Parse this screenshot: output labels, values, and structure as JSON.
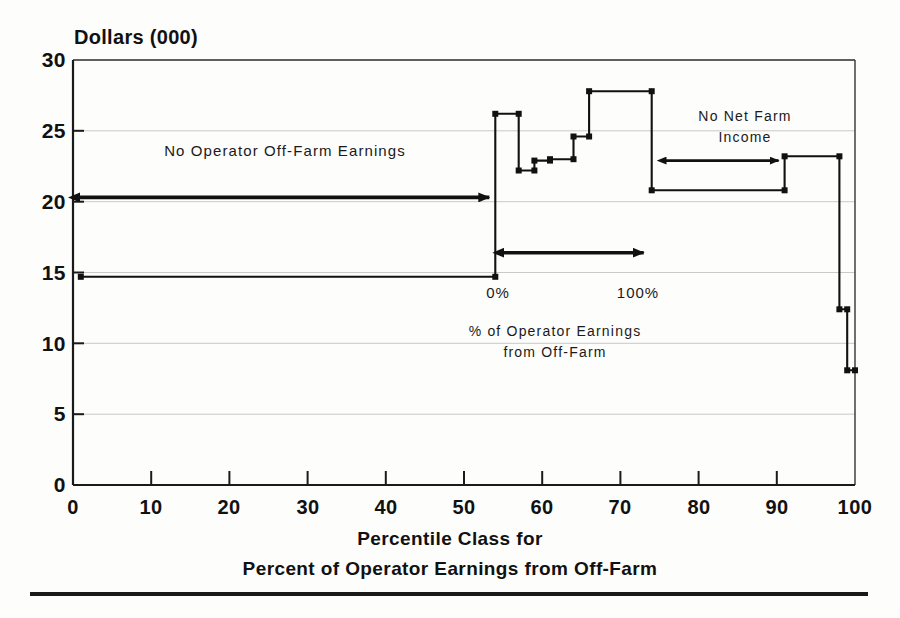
{
  "figure": {
    "ylabel": "Dollars (000)",
    "xtitle_line1": "Percentile Class for",
    "xtitle_line2": "Percent of Operator Earnings from Off-Farm",
    "annotations": {
      "left": "No Operator Off-Farm Earnings",
      "middle_line1": "% of Operator Earnings",
      "middle_line2": "from Off-Farm",
      "middle_start": "0%",
      "middle_end": "100%",
      "right_line1": "No Net Farm",
      "right_line2": "Income"
    },
    "colors": {
      "ink": "#111111",
      "grid": "#c9c9c9",
      "axis": "#222222",
      "background": "#fdfdfc"
    }
  },
  "chart_data": {
    "type": "line",
    "title": "",
    "subtitle": "",
    "xlabel": "Percentile Class for Percent of Operator Earnings from Off-Farm",
    "ylabel": "Dollars (000)",
    "xlim": [
      0,
      100
    ],
    "ylim": [
      0,
      30
    ],
    "xticks": [
      0,
      10,
      20,
      30,
      40,
      50,
      60,
      70,
      80,
      90,
      100
    ],
    "yticks": [
      0,
      5,
      10,
      15,
      20,
      25,
      30
    ],
    "grid": true,
    "legend": "none",
    "step_style": "post",
    "series": [
      {
        "name": "Total household income by percentile class",
        "x": [
          1,
          54,
          54,
          57,
          57,
          59,
          59,
          61,
          61,
          64,
          64,
          66,
          66,
          74,
          74,
          91,
          91,
          98,
          98,
          99,
          99,
          100
        ],
        "y": [
          14.7,
          14.7,
          26.2,
          26.2,
          22.2,
          22.2,
          22.9,
          22.9,
          23.0,
          23.0,
          24.6,
          24.6,
          27.8,
          27.8,
          20.8,
          20.8,
          23.2,
          23.2,
          12.4,
          12.4,
          8.1,
          8.1
        ],
        "markers": true
      }
    ],
    "annotations": [
      {
        "text": "No Operator Off-Farm Earnings",
        "x_range": [
          0,
          54
        ],
        "y": 20.3,
        "arrow": "double"
      },
      {
        "text": "% of Operator Earnings from Off-Farm",
        "x_range": [
          54,
          74
        ],
        "y": 16.4,
        "arrow": "double",
        "start_label": "0%",
        "end_label": "100%"
      },
      {
        "text": "No Net Farm Income",
        "x_range": [
          75,
          91
        ],
        "y": 22.9,
        "arrow": "double"
      }
    ]
  }
}
